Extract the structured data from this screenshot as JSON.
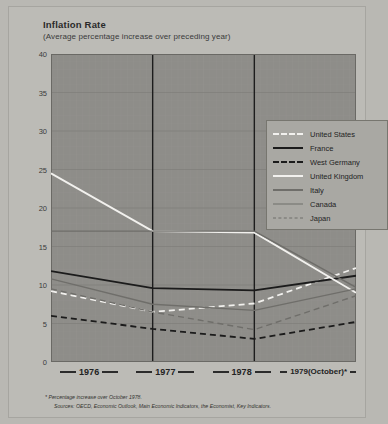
{
  "header": {
    "title": "Inflation Rate",
    "subtitle": "(Average percentage increase over preceding year)"
  },
  "footnotes": {
    "note": "* Percentage increase over  October 1978.",
    "sources": "Sources:  OECD, Economic Outlook, Main Economic Indicators, the Economist, Key Indicators."
  },
  "colors": {
    "page_background": "#b9b8b3",
    "card_background": "#bcbbb6",
    "plot_background": "#8e8d89",
    "grid": "#9a9995",
    "grid_major": "#7c7b77",
    "axis": "#222222",
    "legend_background": "#a9a8a3",
    "white_series": "#f2f1ee",
    "black_series": "#1b1b1b",
    "gray_series": "#6f6e6a"
  },
  "chart_data": {
    "type": "line",
    "title": "Inflation Rate",
    "subtitle": "(Average percentage increase over preceding year)",
    "xlabel": "",
    "ylabel": "",
    "ylim": [
      0,
      40
    ],
    "yticks": [
      0,
      5,
      10,
      15,
      20,
      25,
      30,
      35,
      40
    ],
    "ytick_labels": [
      "0",
      "5",
      "10",
      "15",
      "20",
      "25",
      "30",
      "35",
      "40"
    ],
    "grid": true,
    "legend_position": "upper right",
    "x": [
      "1976",
      "1977",
      "1978",
      "1979(October)*"
    ],
    "categories": [
      "1976",
      "1977",
      "1978",
      "1979(October)*"
    ],
    "series": [
      {
        "name": "United States",
        "style": "dashed",
        "color": "#f2f1ee",
        "values": [
          9.2,
          6.5,
          7.6,
          12.2
        ]
      },
      {
        "name": "France",
        "style": "solid",
        "color": "#1b1b1b",
        "values": [
          11.8,
          9.6,
          9.3,
          11.2
        ]
      },
      {
        "name": "West Germany",
        "style": "dashed",
        "color": "#1b1b1b",
        "values": [
          6.0,
          4.3,
          3.0,
          5.2
        ]
      },
      {
        "name": "United Kingdom",
        "style": "solid",
        "color": "#f2f1ee",
        "values": [
          24.5,
          17.0,
          16.8,
          9.0
        ]
      },
      {
        "name": "Italy",
        "style": "solid",
        "color": "#6f6e6a",
        "values": [
          17.0,
          17.0,
          17.0,
          9.7
        ]
      },
      {
        "name": "Canada",
        "style": "solid",
        "color": "#6f6e6a",
        "values": [
          10.8,
          7.5,
          6.7,
          9.5
        ]
      },
      {
        "name": "Japan",
        "style": "dashed",
        "color": "#6f6e6a",
        "values": [
          9.5,
          6.5,
          4.2,
          8.6
        ]
      }
    ]
  },
  "legend": {
    "items": [
      {
        "label": "United States"
      },
      {
        "label": "France"
      },
      {
        "label": "West Germany"
      },
      {
        "label": "United Kingdom"
      },
      {
        "label": "Italy"
      },
      {
        "label": "Canada"
      },
      {
        "label": "Japan"
      }
    ]
  },
  "xaxis": {
    "labels": [
      "1976",
      "1977",
      "1978",
      "1979(October)*"
    ]
  }
}
